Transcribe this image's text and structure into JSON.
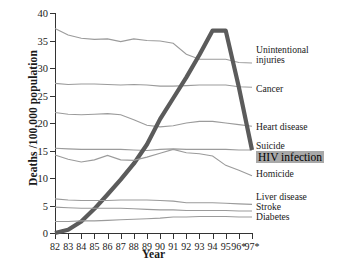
{
  "chart_data": {
    "type": "line",
    "title": "",
    "xlabel": "Year",
    "ylabel": "Deaths /100,000 population",
    "xlim": [
      82,
      97
    ],
    "ylim": [
      0,
      40
    ],
    "ytick_values": [
      0,
      5,
      10,
      15,
      20,
      25,
      30,
      35,
      40
    ],
    "ytick_labels": [
      "0",
      "5",
      "10",
      "15",
      "20",
      "25",
      "30",
      "35",
      "40"
    ],
    "x": [
      82,
      83,
      84,
      85,
      86,
      87,
      88,
      89,
      90,
      91,
      92,
      93,
      94,
      95,
      96,
      97
    ],
    "xtick_labels": [
      "82",
      "83",
      "84",
      "85",
      "86",
      "87",
      "88",
      "89",
      "90",
      "91",
      "92",
      "93",
      "94",
      "95",
      "96*",
      "97*"
    ],
    "grid": false,
    "legend_position": "right-inline",
    "footnote_marker": "*",
    "series": [
      {
        "name": "Unintentional injuries",
        "color": "#9b9b9b",
        "highlight": false,
        "values": [
          37.2,
          36.0,
          35.4,
          35.2,
          35.3,
          34.8,
          35.3,
          35.0,
          34.9,
          34.5,
          32.5,
          31.6,
          31.6,
          31.6,
          31.0,
          30.9
        ]
      },
      {
        "name": "Cancer",
        "color": "#9b9b9b",
        "highlight": false,
        "values": [
          27.2,
          27.0,
          27.1,
          27.1,
          27.0,
          26.9,
          27.0,
          26.9,
          26.7,
          26.7,
          26.8,
          26.9,
          26.9,
          26.9,
          26.6,
          26.5
        ]
      },
      {
        "name": "Heart disease",
        "color": "#9b9b9b",
        "highlight": false,
        "values": [
          21.9,
          21.6,
          21.5,
          21.6,
          21.7,
          21.5,
          20.6,
          19.6,
          19.3,
          19.5,
          20.0,
          20.3,
          20.3,
          20.0,
          19.7,
          19.4
        ]
      },
      {
        "name": "Suicide",
        "color": "#9b9b9b",
        "highlight": false,
        "values": [
          15.4,
          15.3,
          15.2,
          15.2,
          15.2,
          15.2,
          15.1,
          15.0,
          15.2,
          15.3,
          15.2,
          15.2,
          15.2,
          15.2,
          15.1,
          15.1
        ]
      },
      {
        "name": "HIV infection",
        "color": "#5b5b5b",
        "highlight": true,
        "values": [
          0.0,
          0.6,
          2.1,
          4.4,
          7.0,
          9.7,
          12.6,
          16.1,
          20.7,
          24.5,
          28.3,
          32.4,
          36.8,
          36.8,
          26.5,
          15.1
        ]
      },
      {
        "name": "Homicide",
        "color": "#9b9b9b",
        "highlight": false,
        "values": [
          14.2,
          13.4,
          12.9,
          13.3,
          14.1,
          13.3,
          13.2,
          13.8,
          14.5,
          15.2,
          14.6,
          14.4,
          14.0,
          12.3,
          11.4,
          10.4
        ]
      },
      {
        "name": "Liver disease",
        "color": "#9b9b9b",
        "highlight": false,
        "values": [
          6.2,
          6.0,
          5.9,
          5.9,
          5.9,
          6.0,
          6.0,
          6.0,
          5.9,
          5.8,
          5.5,
          5.5,
          5.5,
          5.4,
          5.3,
          5.2
        ]
      },
      {
        "name": "Stroke",
        "color": "#9b9b9b",
        "highlight": false,
        "values": [
          4.7,
          4.6,
          4.5,
          4.5,
          4.5,
          4.5,
          4.4,
          4.3,
          4.2,
          4.2,
          4.1,
          4.1,
          4.1,
          4.1,
          4.0,
          4.0
        ]
      },
      {
        "name": "Diabetes",
        "color": "#9b9b9b",
        "highlight": false,
        "values": [
          2.1,
          2.1,
          2.2,
          2.2,
          2.3,
          2.4,
          2.5,
          2.6,
          2.7,
          2.9,
          2.9,
          3.0,
          3.0,
          3.0,
          2.9,
          2.9
        ]
      }
    ],
    "right_labels": [
      {
        "key": "unintentional",
        "lines": [
          "Unintentional",
          "injuries"
        ],
        "y": 45,
        "highlight": false
      },
      {
        "key": "cancer",
        "lines": [
          "Cancer"
        ],
        "y": 84,
        "highlight": false
      },
      {
        "key": "heart-disease",
        "lines": [
          "Heart disease"
        ],
        "y": 122,
        "highlight": false
      },
      {
        "key": "suicide",
        "lines": [
          "Suicide"
        ],
        "y": 141,
        "highlight": false
      },
      {
        "key": "hiv-infection",
        "lines": [
          "HIV infection"
        ],
        "y": 151,
        "highlight": true
      },
      {
        "key": "homicide",
        "lines": [
          "Homicide"
        ],
        "y": 169,
        "highlight": false
      },
      {
        "key": "liver-disease",
        "lines": [
          "Liver disease"
        ],
        "y": 192,
        "highlight": false
      },
      {
        "key": "stroke",
        "lines": [
          "Stroke"
        ],
        "y": 202,
        "highlight": false
      },
      {
        "key": "diabetes",
        "lines": [
          "Diabetes"
        ],
        "y": 212,
        "highlight": false
      }
    ]
  }
}
